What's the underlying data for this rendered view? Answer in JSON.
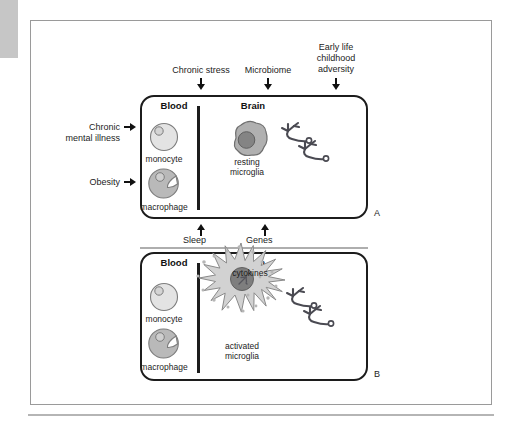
{
  "figure": {
    "panel_a_letter": "A",
    "panel_b_letter": "B"
  },
  "drivers": [
    {
      "label": "Chronic stress",
      "icon": "down-arrow-icon"
    },
    {
      "label": "Microbiome",
      "icon": "down-arrow-icon"
    },
    {
      "label": "Early life\nchildhood\nadversity",
      "line1": "Early life",
      "line2": "childhood",
      "line3": "adversity",
      "icon": "down-arrow-icon"
    }
  ],
  "side_inputs": [
    {
      "line1": "Chronic",
      "line2": "mental illness",
      "icon": "right-arrow-icon"
    },
    {
      "line1": "Obesity",
      "line2": "",
      "icon": "right-arrow-icon"
    }
  ],
  "feedback": [
    {
      "label": "Sleep",
      "icon": "up-arrow-icon"
    },
    {
      "label": "Genes",
      "icon": "up-arrow-icon"
    }
  ],
  "panel_a": {
    "letter": "A",
    "compartments": {
      "blood": "Blood",
      "brain": "Brain"
    },
    "blood_cells": [
      {
        "name": "monocyte",
        "caption": "monocyte",
        "fill": "#e3e3e3"
      },
      {
        "name": "macrophage",
        "caption": "macrophage",
        "fill": "#b9b9b9"
      }
    ],
    "microglia": {
      "caption_line1": "resting",
      "caption_line2": "microglia",
      "state": "resting",
      "fill": "#b0b0b0",
      "nucleus": "#848484"
    },
    "neurons_count": 2
  },
  "panel_b": {
    "letter": "B",
    "compartments": {
      "blood": "Blood",
      "brain": "Brain"
    },
    "blood_cells": [
      {
        "name": "monocyte",
        "caption": "monocyte",
        "fill": "#e3e3e3"
      },
      {
        "name": "macrophage",
        "caption": "macrophage",
        "fill": "#b9b9b9"
      }
    ],
    "microglia": {
      "caption_line1": "activated",
      "caption_line2": "microglia",
      "state": "activated",
      "fill": "#d2d2d2",
      "nucleus": "#7e7e7e"
    },
    "cytokines_label": "cytokines",
    "neurons_count": 2
  },
  "colors": {
    "ink": "#1c1c1c",
    "frame": "#9a9a9a",
    "margin_tab": "#c6c6c6",
    "rule": "#aeaeae",
    "neuron": "#4a4a52",
    "cell_light": "#e3e3e3",
    "cell_mid": "#b9b9b9",
    "cell_dark": "#848484"
  }
}
